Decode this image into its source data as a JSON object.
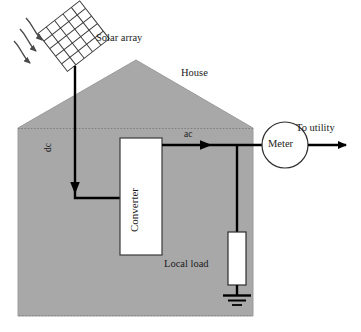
{
  "figure": {
    "background_color": "#ffffff",
    "line_color": "#000000",
    "text_color": "#1b1b1b",
    "house_fill_color": "#a8a8a8",
    "house_stroke_color": "#9a9a9a",
    "component_fill_color": "#ffffff"
  },
  "labels": {
    "solar_array": "Solar array",
    "house": "House",
    "converter": "Converter",
    "meter": "Meter",
    "to_utility": "To utility",
    "local_load": "Local load",
    "dc": "dc",
    "ac": "ac"
  },
  "components": {
    "solar_array": {
      "name": "Solar array",
      "shape": "tilted-grid-panel",
      "grid_rows": 5,
      "grid_cols": 5,
      "sun_arrows": 3
    },
    "converter": {
      "name": "Converter",
      "shape": "rectangle",
      "input": "dc",
      "output": "ac"
    },
    "meter": {
      "name": "Meter",
      "shape": "circle"
    },
    "local_load": {
      "name": "Local load",
      "shape": "resistor-rectangle",
      "terminated_with": "ground"
    },
    "ground": {
      "name": "Ground",
      "shape": "three-bar-earth-symbol"
    },
    "house": {
      "name": "House",
      "shape": "pentagon-gable"
    }
  },
  "connections": [
    {
      "from": "solar_array",
      "to": "converter",
      "label": "dc"
    },
    {
      "from": "converter",
      "to": "meter",
      "label": "ac"
    },
    {
      "from": "ac_bus",
      "to": "local_load",
      "label": ""
    },
    {
      "from": "meter",
      "to": "utility",
      "label": "To utility"
    },
    {
      "from": "local_load",
      "to": "ground",
      "label": ""
    }
  ]
}
